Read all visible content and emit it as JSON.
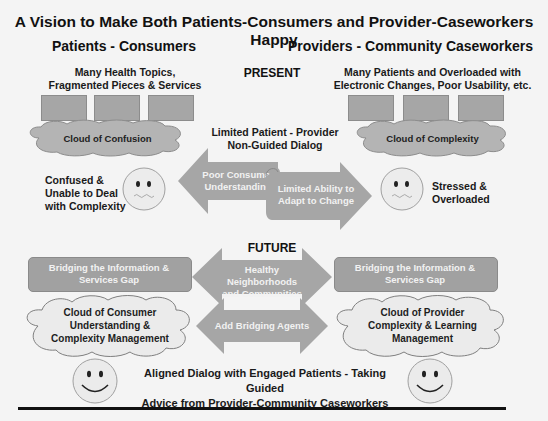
{
  "title": "A Vision to Make Both Patients-Consumers and Provider-Caseworkers Happy",
  "columns": {
    "left": "Patients - Consumers",
    "right": "Providers - Community Caseworkers"
  },
  "present": {
    "section_label": "PRESENT",
    "left_heading": [
      "Many  Health Topics,",
      "Fragmented Pieces & Services"
    ],
    "right_heading": [
      "Many Patients and Overloaded with",
      "Electronic Changes, Poor Usability, etc."
    ],
    "left_cloud": "Cloud of Confusion",
    "right_cloud": "Cloud of Complexity",
    "dialog_label": [
      "Limited Patient - Provider",
      "Non-Guided Dialog"
    ],
    "left_arrow": [
      "Poor Consumer",
      "Understanding"
    ],
    "right_arrow": [
      "Limited Ability to",
      "Adapt to Change"
    ],
    "left_face_caption": [
      "Confused &",
      "Unable to Deal",
      "with Complexity"
    ],
    "right_face_caption": [
      "Stressed &",
      "Overloaded"
    ],
    "left_face": "worried-face-icon",
    "right_face": "worried-face-icon"
  },
  "future": {
    "section_label": "FUTURE",
    "left_box": [
      "Bridging the Information &",
      "Services Gap"
    ],
    "right_box": [
      "Bridging the Information &",
      "Services Gap"
    ],
    "top_arrow": [
      "Healthy Neighborhoods",
      "and Communities"
    ],
    "bottom_arrow": "Add Bridging Agents",
    "left_cloud": [
      "Cloud of Consumer",
      "Understanding &",
      "Complexity Management"
    ],
    "right_cloud": [
      "Cloud of  Provider",
      "Complexity & Learning",
      "Management"
    ],
    "bottom_label": [
      "Aligned  Dialog with Engaged Patients - Taking Guided",
      "Advice from Provider-Community Caseworkers"
    ],
    "left_face": "smiley-face-icon",
    "right_face": "smiley-face-icon"
  },
  "colors": {
    "background": "#f4f4f4",
    "shape_gray": "#a6a6a6",
    "cloud_gray": "#b4b4b4",
    "face_fill": "#ebebeb",
    "arrow_text": "#f2f2f2"
  }
}
